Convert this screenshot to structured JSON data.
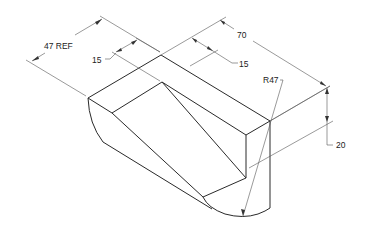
{
  "drawing": {
    "type": "isometric-part-drawing",
    "line_color": "#2a2a2a",
    "dim_color": "#444444",
    "dimensions": [
      {
        "id": "overall-depth",
        "label": "47 REF"
      },
      {
        "id": "inset-left",
        "label": "15"
      },
      {
        "id": "overall-length",
        "label": "70"
      },
      {
        "id": "inset-right",
        "label": "15"
      },
      {
        "id": "radius",
        "label": "R47"
      },
      {
        "id": "height",
        "label": "20"
      }
    ]
  }
}
